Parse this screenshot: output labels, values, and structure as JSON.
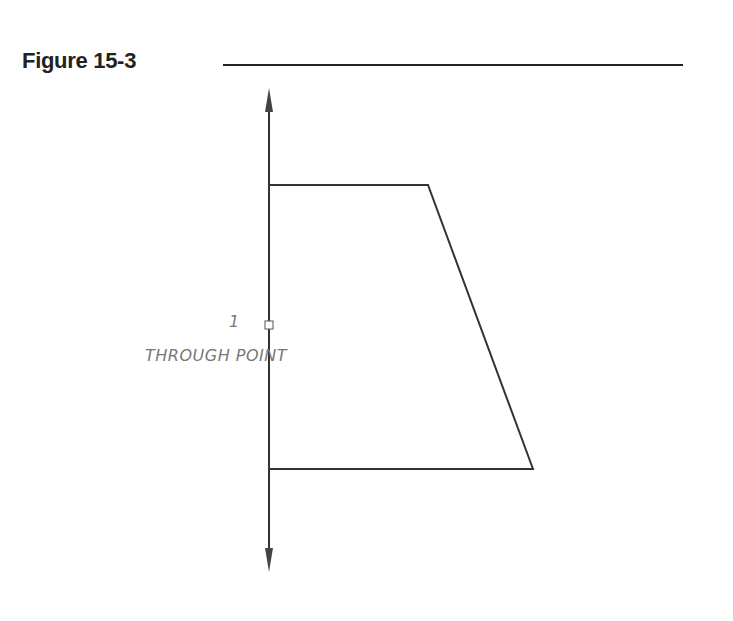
{
  "figure": {
    "title": "Figure 15-3",
    "annotation": {
      "number": "1",
      "label": "THROUGH POINT"
    },
    "shape": "trapezoid",
    "axis": "vertical-double-arrow"
  }
}
